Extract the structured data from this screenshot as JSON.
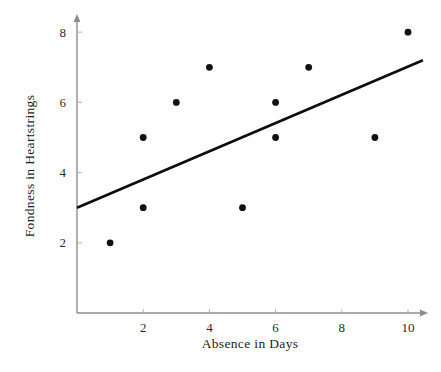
{
  "chart_data": {
    "type": "scatter",
    "title": "",
    "xlabel": "Absence in Days",
    "ylabel": "Fondness in Heartstrings",
    "xlim": [
      0,
      10.6
    ],
    "ylim": [
      0,
      8.6
    ],
    "xticks": [
      2,
      4,
      6,
      8,
      10
    ],
    "yticks": [
      2,
      4,
      6,
      8
    ],
    "xtick_labels": [
      "2",
      "4",
      "6",
      "8",
      "10"
    ],
    "ytick_labels": [
      "2",
      "4",
      "6",
      "8"
    ],
    "grid": false,
    "legend": "none",
    "points": [
      {
        "x": 1,
        "y": 2
      },
      {
        "x": 2,
        "y": 5
      },
      {
        "x": 2,
        "y": 3
      },
      {
        "x": 3,
        "y": 6
      },
      {
        "x": 4,
        "y": 7
      },
      {
        "x": 5,
        "y": 3
      },
      {
        "x": 6,
        "y": 6
      },
      {
        "x": 6,
        "y": 5
      },
      {
        "x": 7,
        "y": 7
      },
      {
        "x": 9,
        "y": 5
      },
      {
        "x": 10,
        "y": 8
      }
    ],
    "trend_line": {
      "name": "line of best fit",
      "x_start": 0,
      "y_start": 3.0,
      "x_end": 10.45,
      "y_end": 7.2
    },
    "marker": {
      "shape": "circle",
      "radius_px": 3.4,
      "color": "#111111"
    },
    "colors": {
      "point": "#111111",
      "line": "#0d0d0d",
      "axis": "#8c8c8c",
      "text": "#1c1c1c",
      "background": "#ffffff"
    }
  }
}
